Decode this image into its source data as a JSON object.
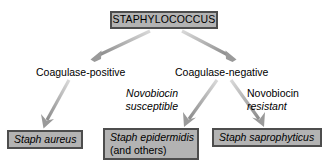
{
  "diagram": {
    "colors": {
      "box_fill": "#b3b3b3",
      "box_border": "#4d4d4d",
      "arrow": "#a6a6a6",
      "text": "#000000",
      "background": "#ffffff"
    },
    "nodes": {
      "root": {
        "label": "STAPHYLOCOCCUS"
      },
      "aureus": {
        "label": "Staph aureus"
      },
      "epidermidis": {
        "label": "Staph epidermidis",
        "sublabel": "(and others)"
      },
      "saprophyticus": {
        "label": "Staph saprophyticus"
      }
    },
    "branch_labels": {
      "coagulase_positive": "Coagulase-positive",
      "coagulase_negative": "Coagulase-negative",
      "novobiocin_susceptible_line1": "Novobiocin",
      "novobiocin_susceptible_line2": "susceptible",
      "novobiocin_resistant_line1": "Novobiocin",
      "novobiocin_resistant_line2": "resistant"
    },
    "arrows": [
      {
        "name": "arrow-root-to-coagulase-positive",
        "from": "STAPHYLOCOCCUS",
        "to": "Coagulase-positive"
      },
      {
        "name": "arrow-root-to-coagulase-negative",
        "from": "STAPHYLOCOCCUS",
        "to": "Coagulase-negative"
      },
      {
        "name": "arrow-coagulase-positive-to-aureus",
        "from": "Coagulase-positive",
        "to": "Staph aureus"
      },
      {
        "name": "arrow-coagulase-negative-to-epidermidis",
        "from": "Coagulase-negative",
        "to": "Staph epidermidis"
      },
      {
        "name": "arrow-coagulase-negative-to-saprophyticus",
        "from": "Coagulase-negative",
        "to": "Staph saprophyticus"
      }
    ]
  }
}
